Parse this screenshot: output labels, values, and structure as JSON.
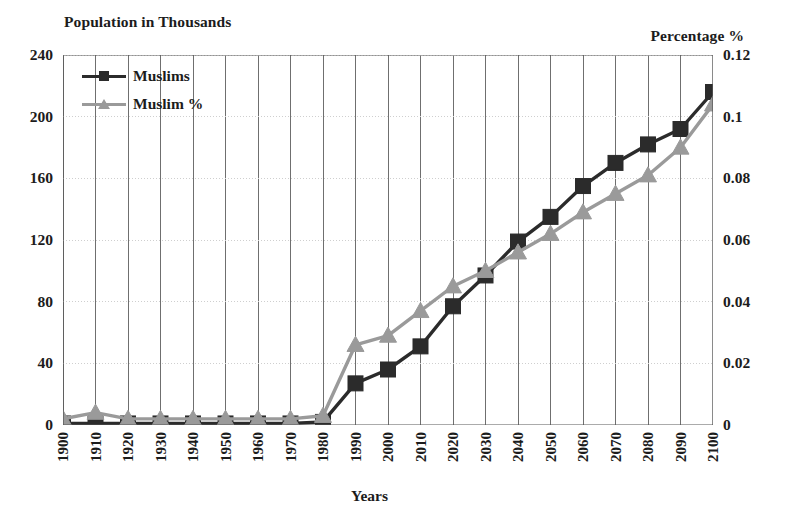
{
  "chart_data": {
    "type": "line",
    "title": "",
    "xlabel": "Years",
    "ylabel": "Population in Thousands",
    "y2label": "Percentage %",
    "grid": true,
    "legend_position": "top-left",
    "xlim": [
      1900,
      2100
    ],
    "ylim": [
      0,
      240
    ],
    "y2lim": [
      0,
      0.12
    ],
    "yticks": [
      "0",
      "40",
      "80",
      "120",
      "160",
      "200",
      "240"
    ],
    "y2ticks": [
      "0",
      "0.02",
      "0.04",
      "0.06",
      "0.08",
      "0.1",
      "0.12"
    ],
    "categories": [
      "1900",
      "1910",
      "1920",
      "1930",
      "1940",
      "1950",
      "1960",
      "1970",
      "1980",
      "1990",
      "2000",
      "2010",
      "2020",
      "2030",
      "2040",
      "2050",
      "2060",
      "2070",
      "2080",
      "2090",
      "2100"
    ],
    "series": [
      {
        "name": "Muslims",
        "axis": "left",
        "color": "#2b2b2b",
        "marker": "square",
        "values": [
          1,
          1,
          1,
          1,
          1,
          1,
          1,
          1,
          2,
          27,
          36,
          51,
          77,
          97,
          119,
          135,
          155,
          170,
          182,
          192,
          216
        ]
      },
      {
        "name": "Muslim %",
        "axis": "right",
        "color": "#9a9a9a",
        "marker": "triangle",
        "values": [
          0.002,
          0.004,
          0.002,
          0.002,
          0.002,
          0.002,
          0.002,
          0.002,
          0.003,
          0.026,
          0.029,
          0.037,
          0.045,
          0.05,
          0.056,
          0.062,
          0.069,
          0.075,
          0.081,
          0.09,
          0.104
        ]
      }
    ]
  },
  "legend": {
    "items": [
      {
        "label": "Muslims"
      },
      {
        "label": "Muslim %"
      }
    ]
  },
  "axis_titles": {
    "left": "Population in Thousands",
    "right": "Percentage %",
    "bottom": "Years"
  },
  "colors": {
    "series_muslims": "#2b2b2b",
    "series_percent": "#9a9a9a",
    "grid": "#6f6f6f",
    "axis": "#595959",
    "text": "#1c1c1c"
  }
}
